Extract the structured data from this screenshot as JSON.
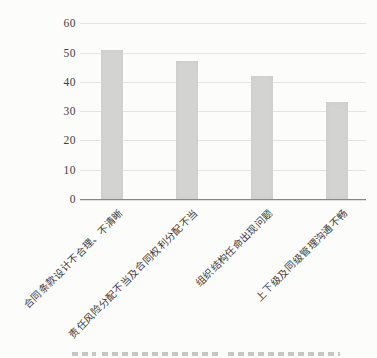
{
  "chart_data": {
    "type": "bar",
    "categories": [
      "合同条款设计不合理、不清晰",
      "责任风险分配不当及合同权利分配不当",
      "组织结构任命出现问题",
      "上下级及同级管理沟通不畅"
    ],
    "values": [
      51,
      47,
      42,
      33
    ],
    "title": "",
    "xlabel": "",
    "ylabel": "",
    "ylim": [
      0,
      60
    ],
    "yticks": [
      0,
      10,
      20,
      30,
      40,
      50,
      60
    ],
    "grid": true,
    "legend_visible": false,
    "colors": {
      "bar": "#d3d3d2",
      "gridline": "#e3e3e2",
      "axis": "#878787",
      "tick_text": "#3e3e3e",
      "label_text": "#3a3a3a"
    }
  },
  "caption": {
    "note": "clipped-illegible"
  }
}
